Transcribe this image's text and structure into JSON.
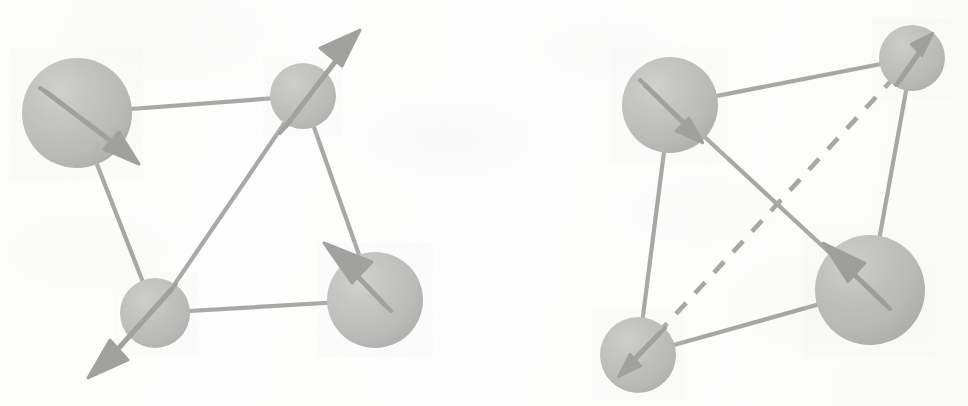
{
  "figure": {
    "background_color": "#fdfdfc",
    "ink_color": "#3a3a3a",
    "sphere_color_light": "#8d8d8b",
    "sphere_color_mid": "#6e6e6c",
    "sphere_color_dark": "#4a4a48",
    "panel_count": 2
  },
  "panels": [
    {
      "id": "left-panel",
      "name": "all-solid-bond-tetrahedron",
      "label": "",
      "bond_style_summary": "six solid bonds",
      "atoms": [
        {
          "id": "L1",
          "name": "atom-top-left",
          "cx": 77,
          "cy": 113,
          "r": 55,
          "size": "large",
          "arrow": {
            "name": "spin-arrow-down-right",
            "direction": "down-right",
            "tail_x": 46,
            "tail_y": 92,
            "head_x": 133,
            "head_y": 159,
            "extends_beyond_sphere": true
          }
        },
        {
          "id": "L2",
          "name": "atom-top-middle",
          "cx": 303,
          "cy": 96,
          "r": 33,
          "size": "small",
          "arrow": {
            "name": "spin-arrow-up-right",
            "direction": "up-right",
            "tail_x": 290,
            "tail_y": 122,
            "head_x": 356,
            "head_y": 36,
            "extends_beyond_sphere": true
          }
        },
        {
          "id": "L3",
          "name": "atom-bottom-left",
          "cx": 155,
          "cy": 313,
          "r": 35,
          "size": "small",
          "arrow": {
            "name": "spin-arrow-down-left",
            "direction": "down-left",
            "tail_x": 169,
            "tail_y": 292,
            "head_x": 93,
            "head_y": 372,
            "extends_beyond_sphere": true
          }
        },
        {
          "id": "L4",
          "name": "atom-bottom-right",
          "cx": 375,
          "cy": 300,
          "r": 48,
          "size": "large",
          "arrow": {
            "name": "spin-arrow-up-left",
            "direction": "up-left",
            "tail_x": 383,
            "tail_y": 303,
            "head_x": 329,
            "head_y": 247,
            "extends_beyond_sphere": true
          }
        }
      ],
      "bonds": [
        {
          "name": "bond-L1-L2",
          "from": "L1",
          "to": "L2",
          "style": "solid"
        },
        {
          "name": "bond-L1-L3",
          "from": "L1",
          "to": "L3",
          "style": "solid"
        },
        {
          "name": "bond-L2-L3",
          "from": "L2",
          "to": "L3",
          "style": "solid"
        },
        {
          "name": "bond-L2-L4",
          "from": "L2",
          "to": "L4",
          "style": "solid"
        },
        {
          "name": "bond-L3-L4",
          "from": "L3",
          "to": "L4",
          "style": "solid"
        }
      ]
    },
    {
      "id": "right-panel",
      "name": "dashed-bond-tetrahedron",
      "label": "",
      "bond_style_summary": "five solid bonds and one dashed bond",
      "atoms": [
        {
          "id": "R1",
          "name": "atom-top-left",
          "cx": 670,
          "cy": 105,
          "r": 48,
          "size": "large",
          "arrow": {
            "name": "spin-arrow-down-right",
            "direction": "down-right",
            "tail_x": 648,
            "tail_y": 88,
            "head_x": 700,
            "head_y": 140,
            "extends_beyond_sphere": false
          }
        },
        {
          "id": "R2",
          "name": "atom-top-right",
          "cx": 912,
          "cy": 58,
          "r": 33,
          "size": "small",
          "arrow": {
            "name": "spin-arrow-up-right",
            "direction": "up-right",
            "tail_x": 903,
            "tail_y": 76,
            "head_x": 930,
            "head_y": 37,
            "extends_beyond_sphere": false
          }
        },
        {
          "id": "R3",
          "name": "atom-bottom-left",
          "cx": 638,
          "cy": 355,
          "r": 38,
          "size": "small",
          "arrow": {
            "name": "spin-arrow-down-left",
            "direction": "down-left",
            "tail_x": 657,
            "tail_y": 336,
            "head_x": 622,
            "head_y": 372,
            "extends_beyond_sphere": false
          }
        },
        {
          "id": "R4",
          "name": "atom-bottom-right",
          "cx": 870,
          "cy": 290,
          "r": 55,
          "size": "large",
          "arrow": {
            "name": "spin-arrow-up-left",
            "direction": "up-left",
            "tail_x": 882,
            "tail_y": 300,
            "head_x": 826,
            "head_y": 246,
            "extends_beyond_sphere": false
          }
        }
      ],
      "bonds": [
        {
          "name": "bond-R1-R2",
          "from": "R1",
          "to": "R2",
          "style": "solid"
        },
        {
          "name": "bond-R1-R3",
          "from": "R1",
          "to": "R3",
          "style": "solid"
        },
        {
          "name": "bond-R1-R4",
          "from": "R1",
          "to": "R4",
          "style": "solid"
        },
        {
          "name": "bond-R2-R4",
          "from": "R2",
          "to": "R4",
          "style": "solid"
        },
        {
          "name": "bond-R3-R4",
          "from": "R3",
          "to": "R4",
          "style": "solid"
        },
        {
          "name": "bond-R3-R2-dashed",
          "from": "R3",
          "to": "R2",
          "style": "dashed"
        }
      ]
    }
  ]
}
